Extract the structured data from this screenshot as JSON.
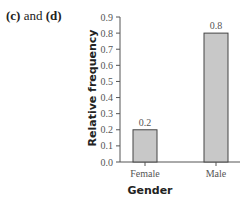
{
  "caption": {
    "part1": "(c)",
    "mid": " and ",
    "part2": "(d)"
  },
  "chart_data": {
    "type": "bar",
    "title": "",
    "categories": [
      "Female",
      "Male"
    ],
    "values": [
      0.2,
      0.8
    ],
    "data_labels": [
      "0.2",
      "0.8"
    ],
    "xlabel": "Gender",
    "ylabel": "Relative frequency",
    "ylim": [
      0.0,
      0.9
    ],
    "yticks": [
      "0.0",
      "0.1",
      "0.2",
      "0.3",
      "0.4",
      "0.5",
      "0.6",
      "0.7",
      "0.8",
      "0.9"
    ],
    "grid": false,
    "legend": null,
    "bar_color": "#c8c8c8",
    "bar_edge_color": "#444444"
  }
}
